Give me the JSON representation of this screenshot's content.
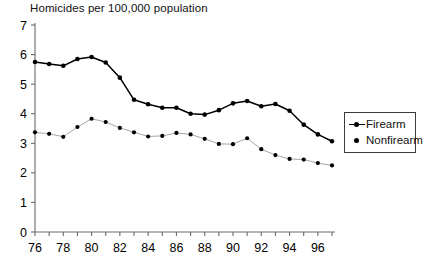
{
  "chart_data": {
    "type": "line",
    "title": "Homicides per 100,000 population",
    "xlabel": "",
    "ylabel": "",
    "xlim": [
      76,
      97
    ],
    "ylim": [
      0,
      7
    ],
    "grid": false,
    "legend_position": "right",
    "x": [
      76,
      77,
      78,
      79,
      80,
      81,
      82,
      83,
      84,
      85,
      86,
      87,
      88,
      89,
      90,
      91,
      92,
      93,
      94,
      95,
      96,
      97
    ],
    "xtick_labels": [
      "76",
      "78",
      "80",
      "82",
      "84",
      "86",
      "88",
      "90",
      "92",
      "94",
      "96"
    ],
    "xtick_values": [
      76,
      78,
      80,
      82,
      84,
      86,
      88,
      90,
      92,
      94,
      96
    ],
    "ytick_labels": [
      "0",
      "1",
      "2",
      "3",
      "4",
      "5",
      "6",
      "7"
    ],
    "ytick_values": [
      0,
      1,
      2,
      3,
      4,
      5,
      6,
      7
    ],
    "series": [
      {
        "name": "Firearm",
        "color": "#000000",
        "marker": "dot-line",
        "values": [
          5.75,
          5.68,
          5.62,
          5.85,
          5.92,
          5.73,
          5.22,
          4.47,
          4.32,
          4.2,
          4.2,
          4.0,
          3.97,
          4.12,
          4.35,
          4.43,
          4.25,
          4.33,
          4.1,
          3.63,
          3.3,
          3.07
        ]
      },
      {
        "name": "Nonfirearm",
        "color": "#000000",
        "marker": "dot",
        "values": [
          3.37,
          3.32,
          3.22,
          3.55,
          3.83,
          3.72,
          3.52,
          3.37,
          3.23,
          3.25,
          3.35,
          3.3,
          3.15,
          2.98,
          2.97,
          3.17,
          2.8,
          2.6,
          2.47,
          2.45,
          2.33,
          2.25
        ]
      }
    ]
  },
  "legend": {
    "items": [
      {
        "label": "Firearm",
        "glyph": "line-with-dot-icon"
      },
      {
        "label": "Nonfirearm",
        "glyph": "dot-icon"
      }
    ]
  }
}
